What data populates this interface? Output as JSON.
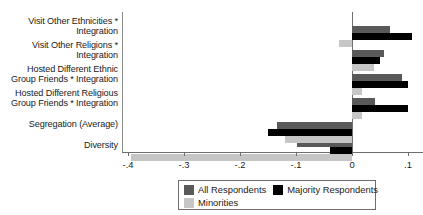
{
  "chart_data": {
    "type": "bar",
    "orientation": "horizontal",
    "title": "",
    "xlabel": "",
    "ylabel": "",
    "xlim": [
      -0.42,
      0.12
    ],
    "grid": false,
    "legend_position": "bottom",
    "categories": [
      "Visit Other Ethnicities *\nIntegration",
      "Visit Other Religions *\nIntegration",
      "Hosted Different Ethnic\nGroup Friends * Integration",
      "Hosted Different Religious\nGroup Friends * Integration",
      "Segregation (Average)",
      "Diversity"
    ],
    "series": [
      {
        "name": "All Respondents",
        "key": "all",
        "color": "#595959",
        "values": [
          0.068,
          0.058,
          0.089,
          0.041,
          -0.134,
          -0.098
        ]
      },
      {
        "name": "Majority Respondents",
        "key": "maj",
        "color": "#000000",
        "values": [
          0.108,
          0.05,
          0.1,
          0.1,
          -0.15,
          -0.04
        ]
      },
      {
        "name": "Minorities",
        "key": "min",
        "color": "#c6c6c6",
        "values": [
          -0.023,
          0.04,
          0.018,
          0.018,
          -0.12,
          -0.395
        ]
      }
    ],
    "xticks": [
      -0.4,
      -0.3,
      -0.2,
      -0.1,
      0,
      0.1
    ],
    "xticklabels": [
      "-.4",
      "-.3",
      "-.2",
      "-.1",
      "0",
      ".1"
    ]
  },
  "legend": {
    "entries": [
      {
        "label": "All Respondents",
        "swatch": "all"
      },
      {
        "label": "Majority Respondents",
        "swatch": "maj"
      },
      {
        "label": "Minorities",
        "swatch": "min"
      }
    ]
  }
}
